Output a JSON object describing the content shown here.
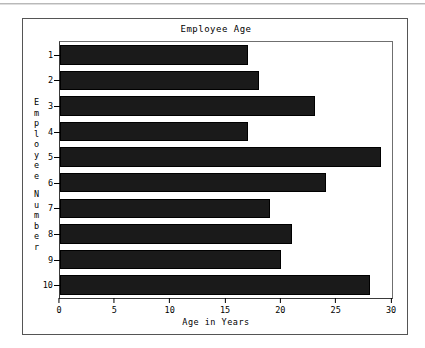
{
  "chart_data": {
    "type": "bar",
    "orientation": "horizontal",
    "title": "Employee Age",
    "xlabel": "Age in Years",
    "ylabel": "Employee Number",
    "categories": [
      "1",
      "2",
      "3",
      "4",
      "5",
      "6",
      "7",
      "8",
      "9",
      "10"
    ],
    "values": [
      17,
      18,
      23,
      17,
      29,
      24,
      19,
      21,
      20,
      28
    ],
    "xlim": [
      0,
      30
    ],
    "xticks": [
      0,
      5,
      10,
      15,
      20,
      25,
      30
    ],
    "xtick_labels": [
      "0",
      "5",
      "10",
      "15",
      "20",
      "25",
      "30"
    ],
    "grid": false,
    "legend": false,
    "bar_color": "#1a1a1a",
    "background_color": "#ffffff",
    "frame_color": "#555555"
  },
  "ylabel_chars": [
    "E",
    "m",
    "p",
    "l",
    "o",
    "y",
    "e",
    "e",
    "N",
    "u",
    "m",
    "b",
    "e",
    "r"
  ]
}
